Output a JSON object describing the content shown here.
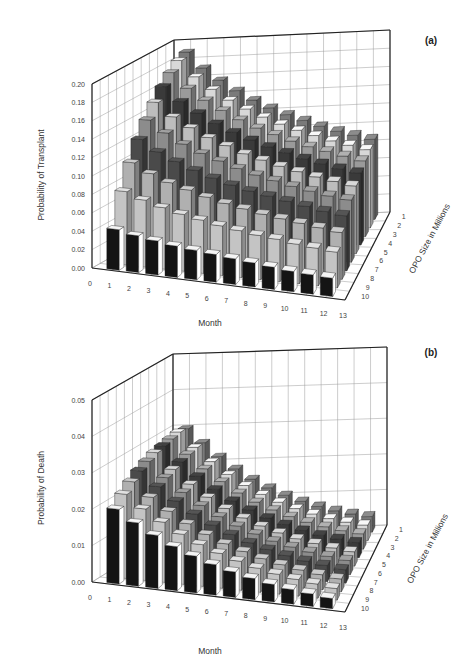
{
  "figure": {
    "panels": [
      "(a)",
      "(b)"
    ]
  },
  "chart_data": [
    {
      "type": "bar",
      "subtype": "3d-bar",
      "panel_label": "(a)",
      "title": "",
      "xlabel": "Month",
      "ylabel": "Probability of Transplant",
      "zlabel": "OPO Size in Millions",
      "x_ticks": [
        "0",
        "1",
        "2",
        "3",
        "4",
        "5",
        "6",
        "7",
        "8",
        "9",
        "10",
        "11",
        "12",
        "13"
      ],
      "z_ticks": [
        "1",
        "2",
        "3",
        "4",
        "5",
        "6",
        "7",
        "8",
        "9",
        "10"
      ],
      "y_ticks": [
        "0.00",
        "0.02",
        "0.04",
        "0.06",
        "0.08",
        "0.10",
        "0.12",
        "0.14",
        "0.16",
        "0.18",
        "0.20"
      ],
      "ylim": [
        0,
        0.2
      ],
      "grid": true,
      "categories": [
        1,
        2,
        3,
        4,
        5,
        6,
        7,
        8,
        9,
        10,
        11,
        12
      ],
      "series": [
        {
          "name": "OPO 1",
          "values": [
            0.19,
            0.172,
            0.158,
            0.146,
            0.135,
            0.126,
            0.118,
            0.111,
            0.104,
            0.098,
            0.093,
            0.088
          ]
        },
        {
          "name": "OPO 2",
          "values": [
            0.186,
            0.168,
            0.154,
            0.142,
            0.132,
            0.123,
            0.115,
            0.108,
            0.102,
            0.096,
            0.091,
            0.086
          ]
        },
        {
          "name": "OPO 3",
          "values": [
            0.178,
            0.161,
            0.148,
            0.137,
            0.127,
            0.118,
            0.111,
            0.104,
            0.098,
            0.093,
            0.088,
            0.083
          ]
        },
        {
          "name": "OPO 4",
          "values": [
            0.168,
            0.152,
            0.14,
            0.129,
            0.12,
            0.112,
            0.105,
            0.099,
            0.093,
            0.088,
            0.083,
            0.079
          ]
        },
        {
          "name": "OPO 5",
          "values": [
            0.156,
            0.141,
            0.13,
            0.12,
            0.112,
            0.104,
            0.098,
            0.092,
            0.087,
            0.082,
            0.078,
            0.074
          ]
        },
        {
          "name": "OPO 6",
          "values": [
            0.142,
            0.129,
            0.118,
            0.109,
            0.102,
            0.095,
            0.089,
            0.084,
            0.079,
            0.075,
            0.071,
            0.068
          ]
        },
        {
          "name": "OPO 7",
          "values": [
            0.126,
            0.114,
            0.105,
            0.097,
            0.09,
            0.084,
            0.079,
            0.075,
            0.071,
            0.067,
            0.063,
            0.06
          ]
        },
        {
          "name": "OPO 8",
          "values": [
            0.106,
            0.096,
            0.088,
            0.082,
            0.076,
            0.071,
            0.067,
            0.063,
            0.06,
            0.057,
            0.054,
            0.051
          ]
        },
        {
          "name": "OPO 9",
          "values": [
            0.08,
            0.073,
            0.067,
            0.062,
            0.058,
            0.054,
            0.051,
            0.048,
            0.046,
            0.043,
            0.041,
            0.039
          ]
        },
        {
          "name": "OPO 10",
          "values": [
            0.044,
            0.04,
            0.037,
            0.034,
            0.032,
            0.03,
            0.028,
            0.026,
            0.024,
            0.022,
            0.021,
            0.02
          ]
        }
      ]
    },
    {
      "type": "bar",
      "subtype": "3d-bar",
      "panel_label": "(b)",
      "title": "",
      "xlabel": "Month",
      "ylabel": "Probability of Death",
      "zlabel": "OPO Size in Millions",
      "x_ticks": [
        "0",
        "1",
        "2",
        "3",
        "4",
        "5",
        "6",
        "7",
        "8",
        "9",
        "10",
        "11",
        "12",
        "13"
      ],
      "z_ticks": [
        "1",
        "2",
        "3",
        "4",
        "5",
        "6",
        "7",
        "8",
        "9",
        "10"
      ],
      "y_ticks": [
        "0.00",
        "0.01",
        "0.02",
        "0.03",
        "0.04",
        "0.05"
      ],
      "ylim": [
        0,
        0.05
      ],
      "grid": true,
      "categories": [
        1,
        2,
        3,
        4,
        5,
        6,
        7,
        8,
        9,
        10,
        11,
        12
      ],
      "series": [
        {
          "name": "OPO 1",
          "values": [
            0.03,
            0.026,
            0.022,
            0.0185,
            0.0155,
            0.013,
            0.0108,
            0.009,
            0.0075,
            0.0062,
            0.0052,
            0.0044
          ]
        },
        {
          "name": "OPO 2",
          "values": [
            0.0305,
            0.0262,
            0.0222,
            0.0186,
            0.0155,
            0.013,
            0.0108,
            0.009,
            0.0075,
            0.0062,
            0.0052,
            0.0044
          ]
        },
        {
          "name": "OPO 3",
          "values": [
            0.03,
            0.0258,
            0.0218,
            0.0183,
            0.0152,
            0.0127,
            0.0106,
            0.0088,
            0.0073,
            0.0061,
            0.0051,
            0.0043
          ]
        },
        {
          "name": "OPO 4",
          "values": [
            0.0295,
            0.0252,
            0.0213,
            0.0178,
            0.0148,
            0.0124,
            0.0103,
            0.0086,
            0.0071,
            0.0059,
            0.005,
            0.0042
          ]
        },
        {
          "name": "OPO 5",
          "values": [
            0.029,
            0.0246,
            0.0207,
            0.0173,
            0.0144,
            0.012,
            0.01,
            0.0083,
            0.0069,
            0.0058,
            0.0048,
            0.004
          ]
        },
        {
          "name": "OPO 6",
          "values": [
            0.028,
            0.0238,
            0.02,
            0.0167,
            0.0139,
            0.0116,
            0.0097,
            0.008,
            0.0067,
            0.0056,
            0.0047,
            0.0039
          ]
        },
        {
          "name": "OPO 7",
          "values": [
            0.0268,
            0.0228,
            0.0192,
            0.016,
            0.0133,
            0.0111,
            0.0092,
            0.0077,
            0.0064,
            0.0053,
            0.0045,
            0.0037
          ]
        },
        {
          "name": "OPO 8",
          "values": [
            0.0252,
            0.0214,
            0.018,
            0.015,
            0.0125,
            0.0104,
            0.0087,
            0.0072,
            0.006,
            0.005,
            0.0042,
            0.0035
          ]
        },
        {
          "name": "OPO 9",
          "values": [
            0.0232,
            0.0197,
            0.0166,
            0.0138,
            0.0115,
            0.0096,
            0.008,
            0.0066,
            0.0055,
            0.0046,
            0.0039,
            0.0032
          ]
        },
        {
          "name": "OPO 10",
          "values": [
            0.0205,
            0.0174,
            0.0146,
            0.0121,
            0.0101,
            0.0084,
            0.007,
            0.0058,
            0.0048,
            0.004,
            0.0034,
            0.0028
          ]
        }
      ]
    }
  ],
  "style": {
    "series_colors": [
      "#7a7a7a",
      "#d8d8d8",
      "#9a9a9a",
      "#3a3a3a",
      "#bdbdbd",
      "#8c8c8c",
      "#4a4a4a",
      "#b0b0b0",
      "#c4c4c4",
      "#141414"
    ],
    "grid_color": "#9a9a9a",
    "axis_color": "#222222"
  },
  "geometry": [
    {
      "FL": [
        92,
        268
      ],
      "FR": [
        345,
        300
      ],
      "BR": [
        390,
        212
      ],
      "BL": [
        174,
        222
      ],
      "topLeftFront": [
        76,
        84
      ],
      "topLeftBack": [
        174,
        40
      ],
      "topRightBack": [
        402,
        53
      ],
      "pxPerUnitFront": 920,
      "pxPerUnitBack": 910,
      "ylabel_pos": [
        44,
        175
      ],
      "xlabel_pos": [
        210,
        326
      ],
      "zlabel_pos": [
        432,
        240
      ],
      "panel_label_pos": [
        431,
        44
      ]
    },
    {
      "FL": [
        92,
        264
      ],
      "FR": [
        345,
        294
      ],
      "BR": [
        387,
        207
      ],
      "BL": [
        173,
        214
      ],
      "topLeftFront": [
        76,
        82
      ],
      "topLeftBack": [
        173,
        36
      ],
      "topRightBack": [
        400,
        50
      ],
      "pxPerUnitFront": 3640,
      "pxPerUnitBack": 3560,
      "ylabel_pos": [
        44,
        170
      ],
      "xlabel_pos": [
        210,
        336
      ],
      "zlabel_pos": [
        430,
        232
      ],
      "panel_label_pos": [
        431,
        38
      ]
    }
  ]
}
